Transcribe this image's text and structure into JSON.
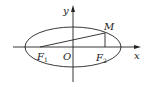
{
  "diagram": {
    "type": "ellipse-foci",
    "labels": {
      "y_axis": "y",
      "x_axis": "x",
      "origin": "O",
      "focus1": "F",
      "focus1_sub": "1",
      "focus2": "F",
      "focus2_sub": "2",
      "point": "M"
    },
    "colors": {
      "stroke": "#222222",
      "background": "#ffffff"
    }
  }
}
